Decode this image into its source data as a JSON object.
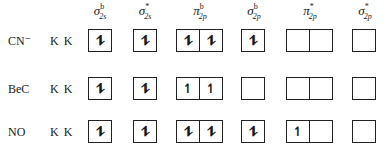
{
  "headers": [
    {
      "symbol": "σ",
      "sup": "b",
      "sub": "2s"
    },
    {
      "symbol": "σ",
      "sup": "*",
      "sub": "2s"
    },
    {
      "symbol": "π",
      "sup": "b",
      "sub": "2p"
    },
    {
      "symbol": "σ",
      "sup": "b",
      "sub": "2p"
    },
    {
      "symbol": "π",
      "sup": "*",
      "sub": "2p"
    },
    {
      "symbol": "σ",
      "sup": "*",
      "sub": "2p"
    }
  ],
  "rows": [
    {
      "molecule": "CN⁻",
      "core": "K K",
      "orbitals": [
        [
          "⥮"
        ],
        [
          "⥮"
        ],
        [
          "⥮",
          "⥮"
        ],
        [
          "⥮"
        ],
        [
          "",
          ""
        ],
        [
          ""
        ]
      ]
    },
    {
      "molecule": "BeC",
      "core": "K K",
      "orbitals": [
        [
          "⥮"
        ],
        [
          "⥮"
        ],
        [
          "↿",
          "↿"
        ],
        [
          ""
        ],
        [
          "",
          ""
        ],
        [
          ""
        ]
      ]
    },
    {
      "molecule": "NO",
      "core": "K K",
      "orbitals": [
        [
          "⥮"
        ],
        [
          "⥮"
        ],
        [
          "⥮",
          "⥮"
        ],
        [
          "⥮"
        ],
        [
          "↿",
          ""
        ],
        [
          ""
        ]
      ]
    }
  ]
}
